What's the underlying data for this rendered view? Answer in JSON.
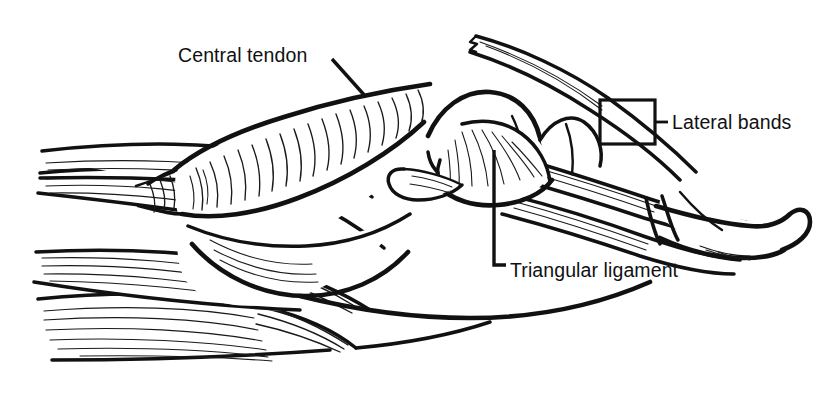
{
  "figure": {
    "background_color": "#ffffff",
    "ink_color": "#111111",
    "width": 822,
    "height": 405
  },
  "labels": {
    "central_tendon": {
      "text": "Central tendon",
      "x": 178,
      "y": 62,
      "leader": "M 332 59 L 366 97"
    },
    "lateral_bands": {
      "text": "Lateral bands",
      "x": 672,
      "y": 129,
      "leader": "M 655 122 L 668 122",
      "box": {
        "x": 600,
        "y": 100,
        "width": 55,
        "height": 44
      }
    },
    "triangular_ligament": {
      "text": "Triangular ligament",
      "x": 510,
      "y": 277,
      "leader": "M 494 150 L 494 265 L 506 265"
    }
  },
  "structures": [
    {
      "name": "central-tendon",
      "kind": "tendon"
    },
    {
      "name": "lateral-band-upper",
      "kind": "tendon"
    },
    {
      "name": "lateral-band-lower",
      "kind": "tendon"
    },
    {
      "name": "triangular-ligament",
      "kind": "ligament"
    },
    {
      "name": "proximal-phalanx",
      "kind": "bone"
    },
    {
      "name": "middle-phalanx",
      "kind": "bone"
    },
    {
      "name": "distal-phalanx",
      "kind": "bone"
    },
    {
      "name": "interosseous-muscle-upper",
      "kind": "muscle"
    },
    {
      "name": "interosseous-muscle-lower",
      "kind": "muscle"
    },
    {
      "name": "lumbrical-muscle",
      "kind": "muscle"
    },
    {
      "name": "cut-tendon-stump",
      "kind": "tendon"
    },
    {
      "name": "sagittal-band",
      "kind": "tendon"
    }
  ]
}
